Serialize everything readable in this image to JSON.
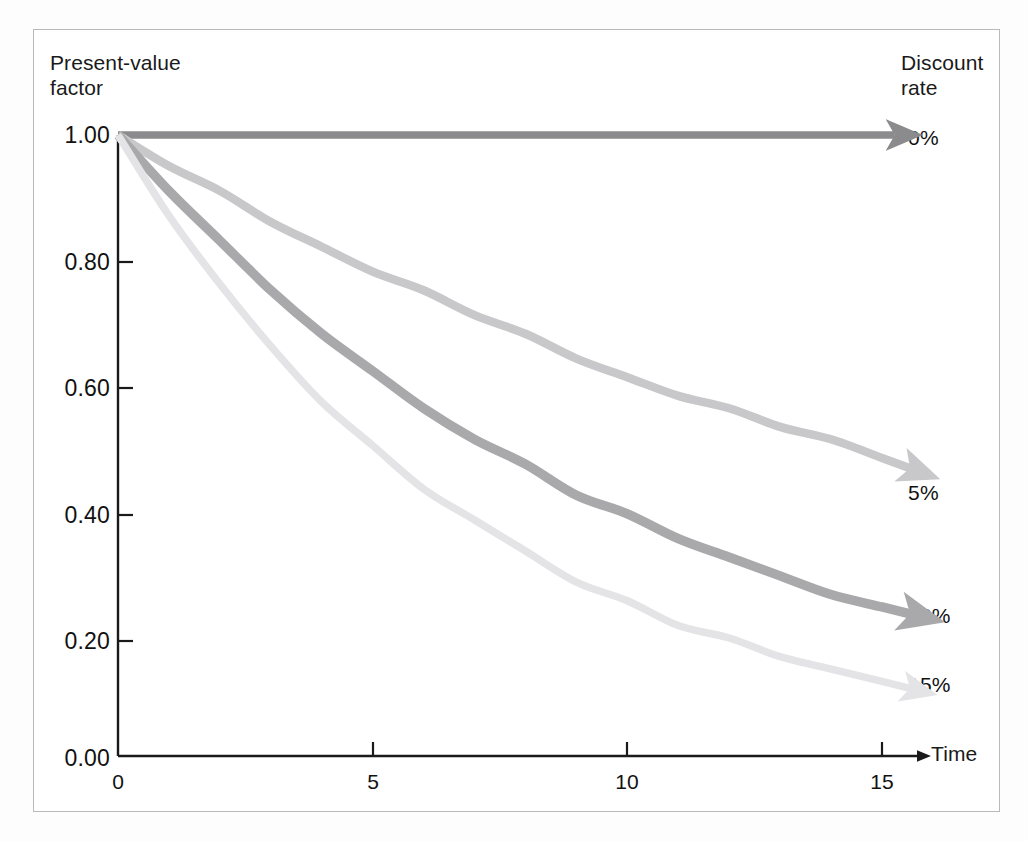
{
  "figure": {
    "background_color": "#ffffff",
    "frame_color": "#b9b9bb"
  },
  "axes": {
    "y_title": "Present-value\nfactor",
    "x_title": "Time",
    "y_ticks": [
      "1.00",
      "0.80",
      "0.60",
      "0.40",
      "0.20",
      "0.00"
    ],
    "x_ticks": [
      "0",
      "5",
      "10",
      "15"
    ]
  },
  "legend": {
    "title": "Discount\nrate",
    "items": [
      {
        "label": "0%",
        "color": "#8b8b8d"
      },
      {
        "label": "5%",
        "color": "#c8c8ca"
      },
      {
        "label": "10%",
        "color": "#a9a9ab"
      },
      {
        "label": "15%",
        "color": "#e4e4e6"
      }
    ]
  },
  "chart_data": {
    "type": "line",
    "title": "",
    "subtitle": "",
    "xlabel": "Time",
    "ylabel": "Present-value factor",
    "xlim": [
      0,
      15
    ],
    "ylim": [
      0.0,
      1.0
    ],
    "grid": false,
    "legend_position": "right",
    "x": [
      0,
      1,
      2,
      3,
      4,
      5,
      6,
      7,
      8,
      9,
      10,
      11,
      12,
      13,
      14,
      15
    ],
    "series": [
      {
        "name": "0%",
        "color": "#8b8b8d",
        "rate": 0.0,
        "values": [
          1.0,
          1.0,
          1.0,
          1.0,
          1.0,
          1.0,
          1.0,
          1.0,
          1.0,
          1.0,
          1.0,
          1.0,
          1.0,
          1.0,
          1.0,
          1.0
        ]
      },
      {
        "name": "5%",
        "color": "#c8c8ca",
        "rate": 0.05,
        "values": [
          1.0,
          0.95,
          0.91,
          0.86,
          0.82,
          0.78,
          0.75,
          0.71,
          0.68,
          0.64,
          0.61,
          0.58,
          0.56,
          0.53,
          0.51,
          0.48
        ]
      },
      {
        "name": "10%",
        "color": "#a9a9ab",
        "rate": 0.1,
        "values": [
          1.0,
          0.91,
          0.83,
          0.75,
          0.68,
          0.62,
          0.56,
          0.51,
          0.47,
          0.42,
          0.39,
          0.35,
          0.32,
          0.29,
          0.26,
          0.24
        ]
      },
      {
        "name": "15%",
        "color": "#e4e4e6",
        "rate": 0.15,
        "values": [
          1.0,
          0.87,
          0.76,
          0.66,
          0.57,
          0.5,
          0.43,
          0.38,
          0.33,
          0.28,
          0.25,
          0.21,
          0.19,
          0.16,
          0.14,
          0.12
        ]
      }
    ],
    "annotations": [
      "Each curve terminates in an arrowhead pointing right toward its discount-rate label."
    ]
  }
}
